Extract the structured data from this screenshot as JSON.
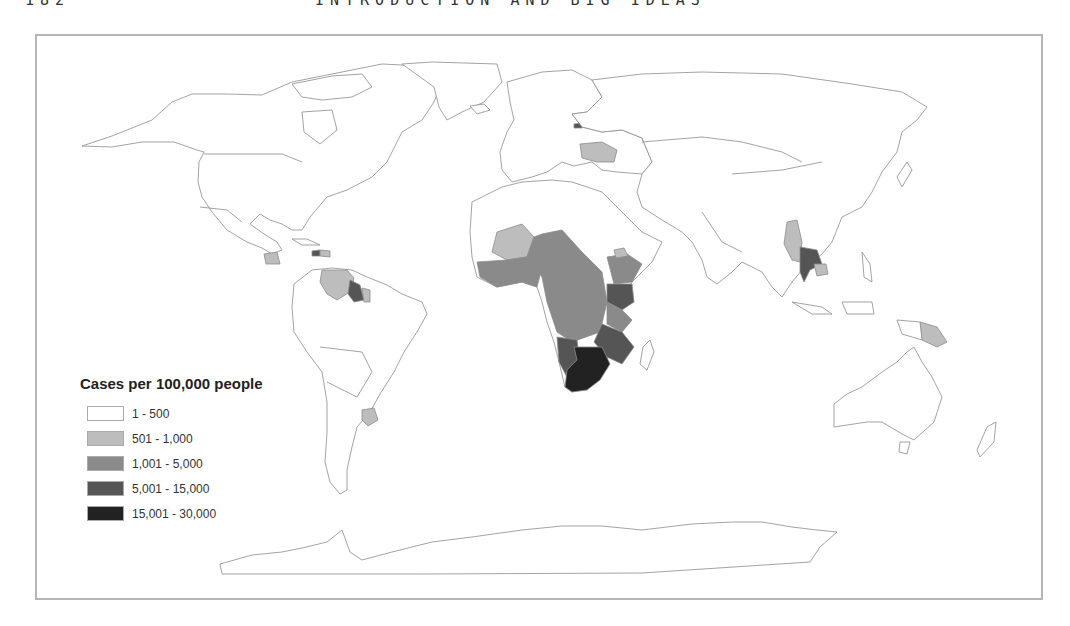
{
  "page": {
    "page_number": "182",
    "running_head": "INTRODUCTION AND BIG IDEAS"
  },
  "map": {
    "type": "choropleth world map",
    "projection": "equirectangular-like world map, Pacific-split",
    "legend": {
      "title": "Cases per 100,000 people",
      "classes": [
        {
          "label": "1 - 500",
          "color": "#ffffff"
        },
        {
          "label": "501 - 1,000",
          "color": "#bdbdbd"
        },
        {
          "label": "1,001 - 5,000",
          "color": "#8a8a8a"
        },
        {
          "label": "5,001 - 15,000",
          "color": "#555555"
        },
        {
          "label": "15,001 - 30,000",
          "color": "#222222"
        }
      ]
    },
    "shaded_regions": [
      {
        "region": "Mali / Burkina Faso / Senegal area (West Africa, Sahel)",
        "class": "501 - 1,000"
      },
      {
        "region": "Coastal West Africa",
        "class": "1,001 - 5,000"
      },
      {
        "region": "Chad / Central Africa / DR Congo / Angola",
        "class": "1,001 - 5,000"
      },
      {
        "region": "Ethiopia / South Sudan",
        "class": "1,001 - 5,000"
      },
      {
        "region": "Eritrea",
        "class": "501 - 1,000"
      },
      {
        "region": "Kenya / Uganda",
        "class": "5,001 - 15,000"
      },
      {
        "region": "Tanzania",
        "class": "1,001 - 5,000"
      },
      {
        "region": "Zambia / Malawi / Mozambique",
        "class": "5,001 - 15,000"
      },
      {
        "region": "Namibia",
        "class": "5,001 - 15,000"
      },
      {
        "region": "Botswana / Zimbabwe / South Africa / Lesotho / Swaziland",
        "class": "15,001 - 30,000"
      },
      {
        "region": "Ukraine",
        "class": "501 - 1,000"
      },
      {
        "region": "Estonia",
        "class": "5,001 - 15,000"
      },
      {
        "region": "Myanmar",
        "class": "501 - 1,000"
      },
      {
        "region": "Thailand",
        "class": "5,001 - 15,000"
      },
      {
        "region": "Cambodia",
        "class": "501 - 1,000"
      },
      {
        "region": "Papua New Guinea",
        "class": "501 - 1,000"
      },
      {
        "region": "Venezuela",
        "class": "501 - 1,000"
      },
      {
        "region": "Guyana",
        "class": "5,001 - 15,000"
      },
      {
        "region": "Suriname",
        "class": "501 - 1,000"
      },
      {
        "region": "Haiti",
        "class": "5,001 - 15,000"
      },
      {
        "region": "Dominican Republic",
        "class": "501 - 1,000"
      },
      {
        "region": "Honduras",
        "class": "501 - 1,000"
      },
      {
        "region": "Uruguay",
        "class": "501 - 1,000"
      }
    ]
  }
}
